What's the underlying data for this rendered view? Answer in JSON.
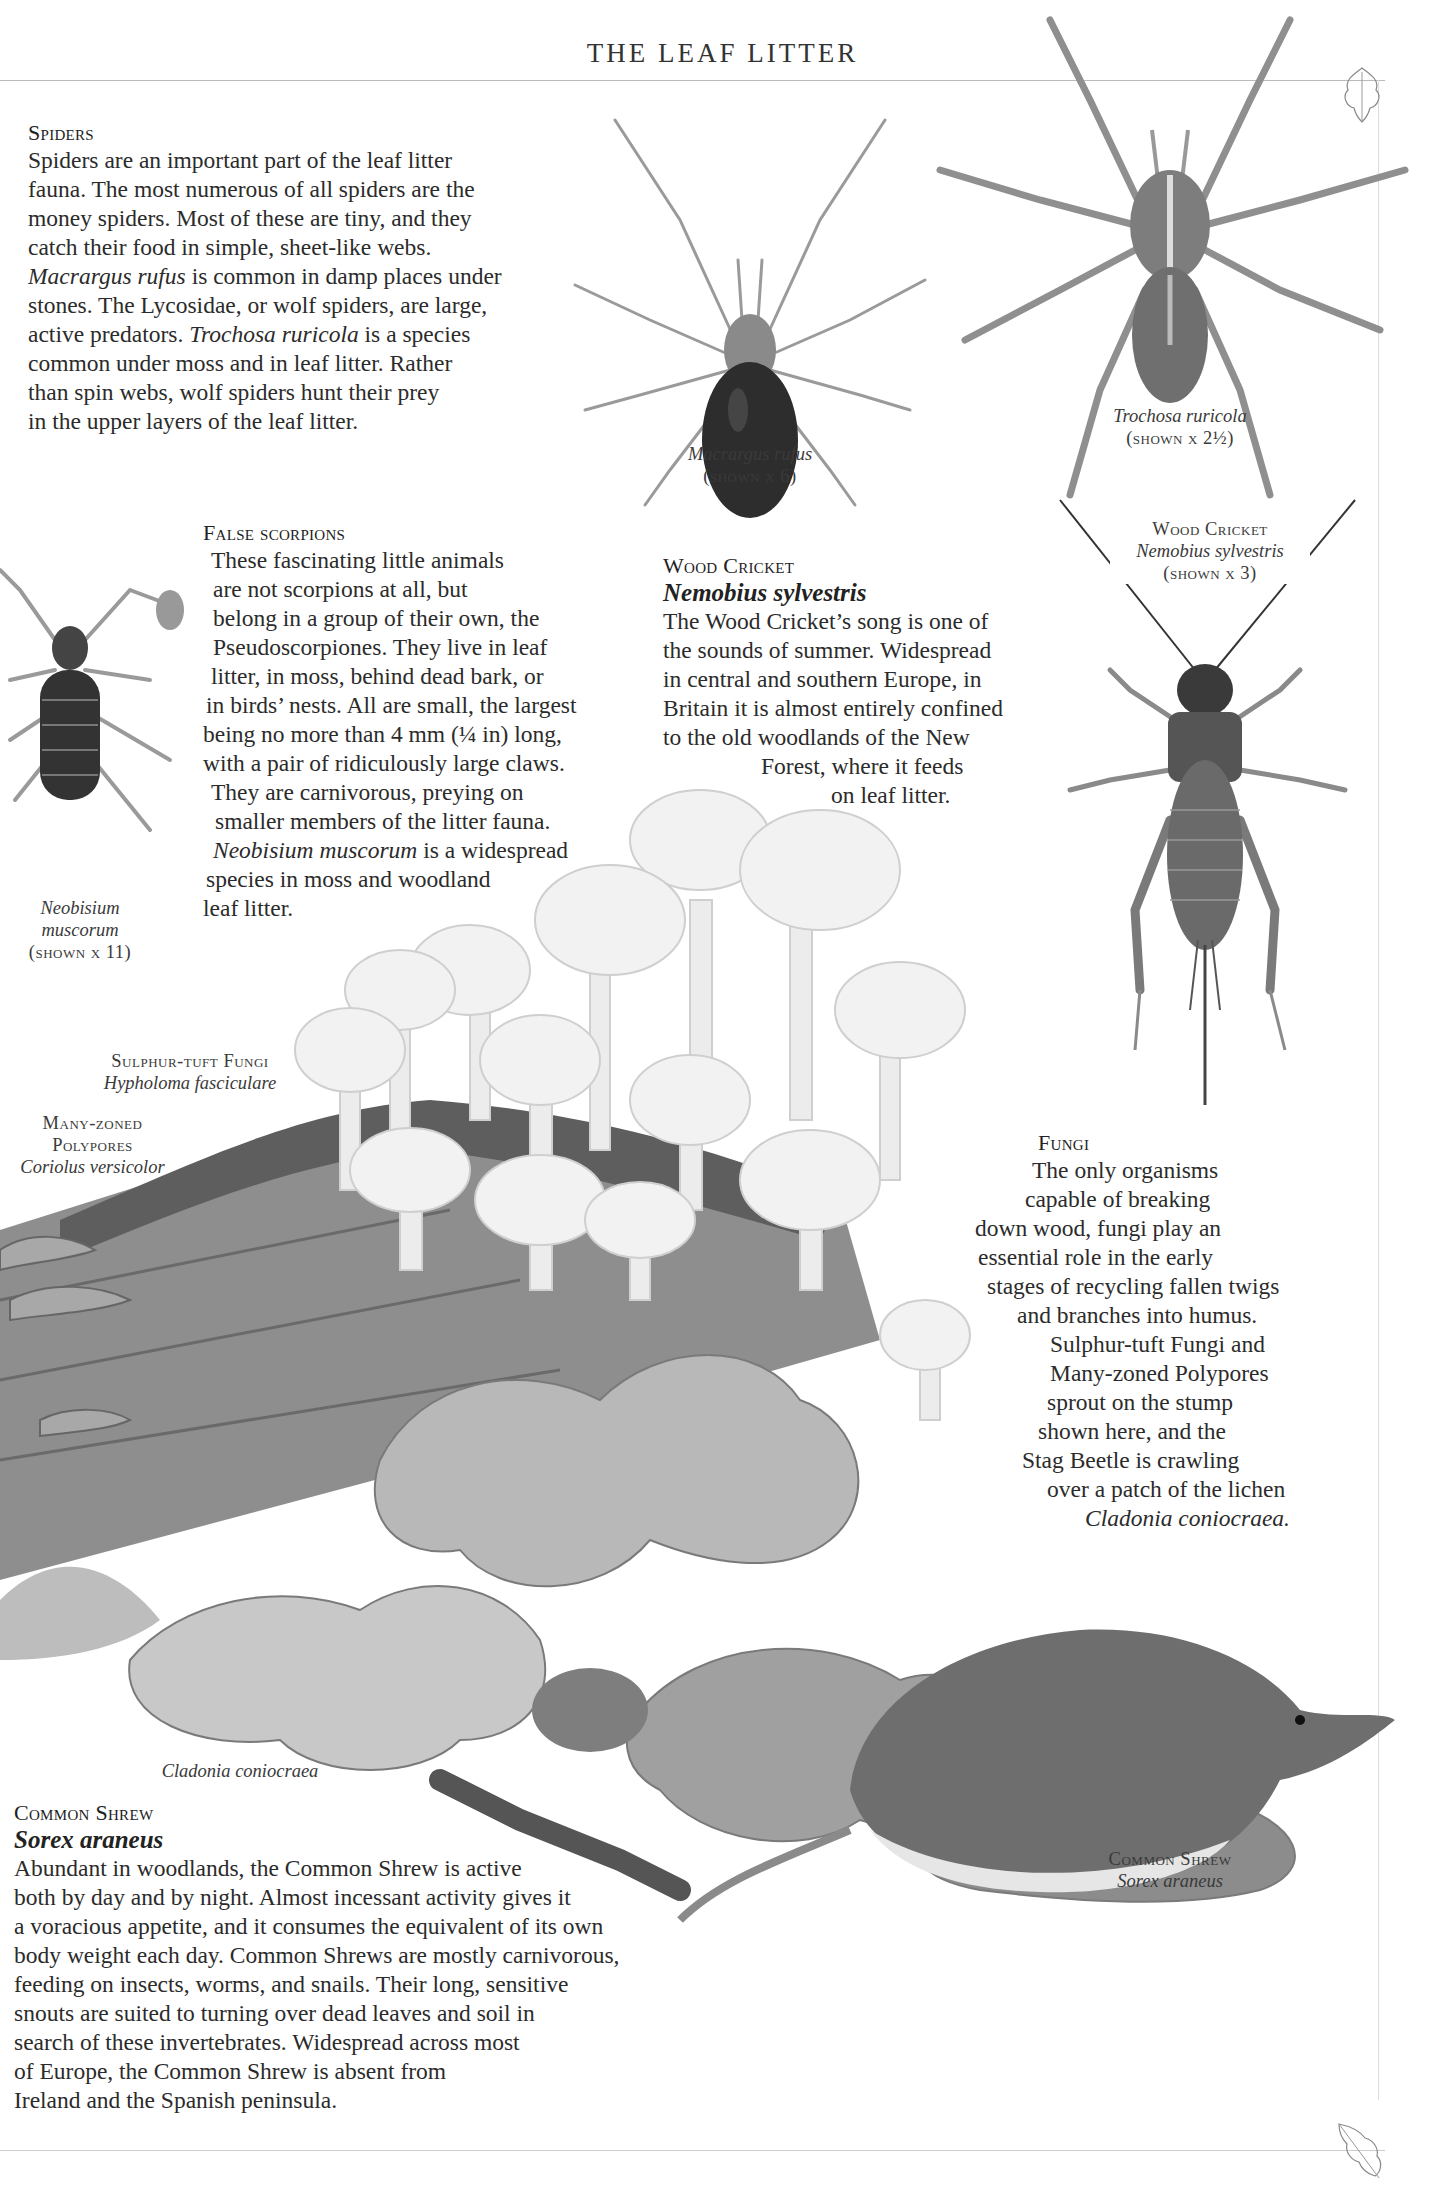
{
  "page": {
    "running_head": "THE LEAF LITTER"
  },
  "spiders": {
    "heading": "Spiders",
    "lines": [
      "Spiders are an important part of the leaf litter",
      "fauna. The most numerous of all spiders are the",
      "money spiders. Most of these are tiny, and they",
      "catch their food in simple, sheet-like webs.",
      [
        "Macrargus rufus",
        " is common in damp places under"
      ],
      "stones. The Lycosidae, or wolf spiders, are large,",
      [
        "active predators. ",
        "Trochosa ruricola",
        " is a species"
      ],
      "common under moss and in leaf litter. Rather",
      "than spin webs, wolf spiders hunt their prey",
      "in the upper layers of the leaf litter."
    ],
    "line_text": {
      "l5_sci": "Macrargus rufus",
      "l5_rest": " is common in damp places under",
      "l7_pre": "active predators. ",
      "l7_sci": "Trochosa ruricola",
      "l7_rest": " is a species"
    }
  },
  "captions": {
    "macrargus": {
      "name": "Macrargus rufus",
      "scale": "(shown x 6)"
    },
    "trochosa": {
      "name": "Trochosa ruricola",
      "scale": "(shown x 2½)"
    },
    "cricket": {
      "common": "Wood Cricket",
      "name": "Nemobius sylvestris",
      "scale": "(shown x 3)"
    },
    "neobisium": {
      "name1": "Neobisium",
      "name2": "muscorum",
      "scale": "(shown x 11)"
    },
    "sulphur": {
      "common": "Sulphur-tuft Fungi",
      "name": "Hypholoma fasciculare"
    },
    "polypores": {
      "common1": "Many-zoned",
      "common2": "Polypores",
      "name": "Coriolus versicolor"
    },
    "cladonia": {
      "name": "Cladonia coniocraea"
    },
    "shrew": {
      "common": "Common Shrew",
      "name": "Sorex araneus"
    }
  },
  "false_scorpions": {
    "heading": "False scorpions",
    "lines": [
      "These fascinating little animals",
      "are not scorpions at all, but",
      "belong in a group of their own, the",
      "Pseudoscorpiones. They live in leaf",
      "litter, in moss, behind dead bark, or",
      "in birds’ nests. All are small, the largest",
      "being no more than 4 mm (¼ in) long,",
      "with a pair of ridiculously large claws.",
      "They are carnivorous, preying on",
      "smaller members of the litter fauna."
    ],
    "l11_sci": "Neobisium muscorum",
    "l11_rest": " is a widespread",
    "l12": "species in moss and woodland",
    "l13": "leaf litter."
  },
  "wood_cricket": {
    "heading": "Wood Cricket",
    "sci": "Nemobius sylvestris",
    "lines": [
      "The Wood Cricket’s song is one of",
      "the sounds of summer. Widespread",
      "in central and southern Europe, in",
      "Britain it is almost entirely confined",
      "to the old woodlands of the New",
      "Forest, where it feeds",
      "on leaf litter."
    ]
  },
  "fungi": {
    "heading": "Fungi",
    "lines": [
      "The only organisms",
      "capable of breaking",
      "down wood, fungi play an",
      "essential role in the early",
      "stages of recycling fallen twigs",
      "and branches into humus.",
      "Sulphur-tuft Fungi and",
      "Many-zoned Polypores",
      "sprout on the stump",
      "shown here, and the",
      "Stag Beetle is crawling",
      "over a patch of the lichen"
    ],
    "last_sci": "Cladonia coniocraea."
  },
  "common_shrew": {
    "heading": "Common Shrew",
    "sci": "Sorex araneus",
    "lines": [
      "Abundant in woodlands, the Common Shrew is active",
      "both by day and by night. Almost incessant activity gives it",
      "a voracious appetite, and it consumes the equivalent of its own",
      "body weight each day. Common Shrews are mostly carnivorous,",
      "feeding on insects, worms, and snails. Their long, sensitive",
      "snouts are suited to turning over dead leaves and soil in",
      "search of these invertebrates. Widespread across most",
      "of Europe, the Common Shrew is absent from",
      "Ireland and the Spanish peninsula."
    ]
  }
}
